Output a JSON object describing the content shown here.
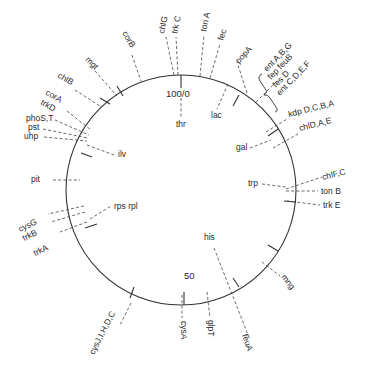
{
  "diagram": {
    "type": "circular genetic map",
    "center": [
      181,
      190
    ],
    "radius": 115,
    "scale_labels": [
      {
        "text": "100/0",
        "x": 166,
        "y": 97
      },
      {
        "text": "50",
        "x": 184,
        "y": 279
      }
    ],
    "ticks": [
      {
        "x1": 181,
        "y1": 75,
        "x2": 181,
        "y2": 88
      },
      {
        "x1": 184,
        "y1": 305,
        "x2": 184,
        "y2": 292
      },
      {
        "x1": 239,
        "y1": 95,
        "x2": 233,
        "y2": 106
      },
      {
        "x1": 278,
        "y1": 129,
        "x2": 268,
        "y2": 136
      },
      {
        "x1": 296,
        "y1": 202,
        "x2": 284,
        "y2": 201
      },
      {
        "x1": 278,
        "y1": 251,
        "x2": 268,
        "y2": 245
      },
      {
        "x1": 239,
        "y1": 287,
        "x2": 233,
        "y2": 278
      },
      {
        "x1": 130,
        "y1": 298,
        "x2": 134,
        "y2": 287
      },
      {
        "x1": 85,
        "y1": 228,
        "x2": 97,
        "y2": 224
      },
      {
        "x1": 81,
        "y1": 153,
        "x2": 92,
        "y2": 157
      },
      {
        "x1": 117,
        "y1": 86,
        "x2": 123,
        "y2": 96
      },
      {
        "x1": 100,
        "y1": 98,
        "x2": 110,
        "y2": 104
      }
    ],
    "genes": [
      {
        "id": "chlG",
        "label": "chlG",
        "rot": -78,
        "x": 164,
        "y": 34,
        "lead": [
          [
            174,
            75
          ],
          [
            166,
            37
          ]
        ]
      },
      {
        "id": "trkC",
        "label": "trk C",
        "rot": -78,
        "x": 177,
        "y": 34,
        "lead": [
          [
            178,
            75
          ],
          [
            176,
            37
          ]
        ]
      },
      {
        "id": "tonA",
        "label": "ton A",
        "rot": -78,
        "x": 206,
        "y": 32,
        "lead": [
          [
            200,
            76
          ],
          [
            204,
            35
          ]
        ]
      },
      {
        "id": "fec",
        "label": "fec",
        "rot": -72,
        "x": 223,
        "y": 41,
        "lead": [
          [
            210,
            78
          ],
          [
            220,
            44
          ]
        ]
      },
      {
        "id": "thr",
        "label": "thr",
        "rot": 0,
        "x": 176,
        "y": 127,
        "lead": [
          [
            181,
            98
          ],
          [
            181,
            117
          ]
        ]
      },
      {
        "id": "lac",
        "label": "lac",
        "rot": 0,
        "x": 211,
        "y": 118,
        "lead": [
          [
            228,
            84
          ],
          [
            217,
            109
          ]
        ]
      },
      {
        "id": "popA",
        "label": "popA",
        "rot": -48,
        "x": 239,
        "y": 64,
        "lead": [
          [
            247,
            93
          ],
          [
            237,
            62
          ]
        ]
      },
      {
        "id": "entABG",
        "label": "ent A,B,G",
        "rot": -46,
        "x": 267,
        "y": 72,
        "lead": null
      },
      {
        "id": "fep_fesB",
        "label": "fep feuB",
        "rot": -46,
        "x": 271,
        "y": 80,
        "lead": null
      },
      {
        "id": "fesD",
        "label": "fes D",
        "rot": -46,
        "x": 276,
        "y": 88,
        "lead": null
      },
      {
        "id": "entCDEF",
        "label": "ent C,D,E,F",
        "rot": -46,
        "x": 280,
        "y": 96,
        "lead": null
      },
      {
        "id": "ent_group_lead",
        "label": "",
        "rot": 0,
        "x": 0,
        "y": 0,
        "lead": [
          [
            256,
            102
          ],
          [
            277,
            81
          ]
        ]
      },
      {
        "id": "kdpDCBA",
        "label": "kdp D,C,B,A",
        "rot": -14,
        "x": 289,
        "y": 117,
        "lead": [
          [
            266,
            132
          ],
          [
            287,
            119
          ]
        ]
      },
      {
        "id": "chlDAE",
        "label": "chlD,A,E",
        "rot": -14,
        "x": 300,
        "y": 131,
        "lead": [
          [
            273,
            148
          ],
          [
            298,
            134
          ]
        ]
      },
      {
        "id": "gal",
        "label": "gal",
        "rot": 0,
        "x": 236,
        "y": 150,
        "lead": [
          [
            250,
            148
          ],
          [
            271,
            140
          ]
        ]
      },
      {
        "id": "chlFC",
        "label": "chlF,C",
        "rot": -14,
        "x": 323,
        "y": 180,
        "lead": [
          [
            286,
            189
          ],
          [
            322,
            177
          ]
        ]
      },
      {
        "id": "tonB",
        "label": "ton B",
        "rot": 0,
        "x": 321,
        "y": 194,
        "lead": [
          [
            286,
            191
          ],
          [
            318,
            191
          ]
        ]
      },
      {
        "id": "trp",
        "label": "trp",
        "rot": 0,
        "x": 248,
        "y": 186,
        "lead": [
          [
            262,
            184
          ],
          [
            286,
            187
          ]
        ]
      },
      {
        "id": "trkE",
        "label": "trk E",
        "rot": 0,
        "x": 323,
        "y": 208,
        "lead": [
          [
            287,
            201
          ],
          [
            320,
            205
          ]
        ]
      },
      {
        "id": "mng",
        "label": "mng",
        "rot": 52,
        "x": 281,
        "y": 277,
        "lead": [
          [
            262,
            262
          ],
          [
            280,
            276
          ]
        ]
      },
      {
        "id": "his",
        "label": "his",
        "rot": 0,
        "x": 204,
        "y": 240,
        "lead": [
          [
            214,
            248
          ],
          [
            250,
            340
          ]
        ]
      },
      {
        "id": "feuA",
        "label": "feuA",
        "rot": 72,
        "x": 242,
        "y": 335,
        "lead": null
      },
      {
        "id": "glpT",
        "label": "glpT",
        "rot": 90,
        "x": 208,
        "y": 320,
        "lead": [
          [
            207,
            292
          ],
          [
            210,
            318
          ]
        ]
      },
      {
        "id": "cysA",
        "label": "cysA",
        "rot": 90,
        "x": 181,
        "y": 321,
        "lead": [
          [
            182,
            295
          ],
          [
            182,
            318
          ]
        ]
      },
      {
        "id": "cysJIHDC",
        "label": "cysJ,I,H,D,C",
        "rot": -63,
        "x": 94,
        "y": 355,
        "lead": [
          [
            131,
            303
          ],
          [
            120,
            325
          ]
        ]
      },
      {
        "id": "trkA",
        "label": "trkA",
        "rot": -25,
        "x": 35,
        "y": 256,
        "lead": [
          [
            87,
            222
          ],
          [
            60,
            232
          ]
        ]
      },
      {
        "id": "cysG",
        "label": "cysG",
        "rot": -25,
        "x": 20,
        "y": 232,
        "lead": [
          [
            84,
            206
          ],
          [
            48,
            214
          ]
        ]
      },
      {
        "id": "trkB",
        "label": "trkB",
        "rot": -25,
        "x": 24,
        "y": 241,
        "lead": [
          [
            85,
            212
          ],
          [
            51,
            222
          ]
        ]
      },
      {
        "id": "rps_rpl",
        "label": "rps rpl",
        "rot": 0,
        "x": 114,
        "y": 209,
        "lead": [
          [
            90,
            219
          ],
          [
            111,
            206
          ]
        ]
      },
      {
        "id": "pit",
        "label": "pit",
        "rot": 0,
        "x": 31,
        "y": 182,
        "lead": [
          [
            53,
            180
          ],
          [
            80,
            180
          ]
        ]
      },
      {
        "id": "ilv",
        "label": "ilv",
        "rot": 0,
        "x": 118,
        "y": 157,
        "lead": [
          [
            87,
            145
          ],
          [
            114,
            155
          ]
        ]
      },
      {
        "id": "uhp",
        "label": "uhp",
        "rot": 0,
        "x": 24,
        "y": 139,
        "lead": [
          [
            44,
            137
          ],
          [
            87,
            141
          ]
        ]
      },
      {
        "id": "pst",
        "label": "pst",
        "rot": 0,
        "x": 28,
        "y": 130,
        "lead": [
          [
            43,
            129
          ],
          [
            88,
            138
          ]
        ]
      },
      {
        "id": "phoST",
        "label": "phoS,T",
        "rot": 0,
        "x": 26,
        "y": 121,
        "lead": [
          [
            55,
            120
          ],
          [
            89,
            135
          ]
        ]
      },
      {
        "id": "trkD",
        "label": "trkD",
        "rot": 30,
        "x": 40,
        "y": 104,
        "lead": [
          [
            67,
            111
          ],
          [
            91,
            130
          ]
        ]
      },
      {
        "id": "corA",
        "label": "corA",
        "rot": 30,
        "x": 45,
        "y": 94,
        "lead": null
      },
      {
        "id": "chlB",
        "label": "chlB",
        "rot": 30,
        "x": 57,
        "y": 77,
        "lead": [
          [
            75,
            90
          ],
          [
            100,
            106
          ]
        ]
      },
      {
        "id": "mgt",
        "label": "mgt",
        "rot": 45,
        "x": 85,
        "y": 60,
        "lead": [
          [
            95,
            71
          ],
          [
            117,
            96
          ]
        ]
      },
      {
        "id": "corB",
        "label": "corB",
        "rot": 60,
        "x": 122,
        "y": 33,
        "lead": [
          [
            132,
            55
          ],
          [
            141,
            81
          ]
        ]
      }
    ]
  }
}
